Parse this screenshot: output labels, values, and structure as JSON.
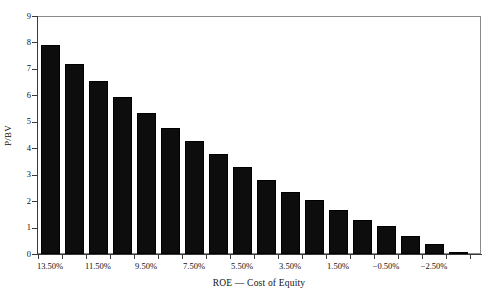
{
  "chart_data": {
    "type": "bar",
    "title": "",
    "xlabel": "ROE — Cost of Equity",
    "ylabel": "P/BV",
    "ylim": [
      0,
      9
    ],
    "ytick_values": [
      0,
      1,
      2,
      3,
      4,
      5,
      6,
      7,
      8,
      9
    ],
    "ytick_labels": [
      "0",
      "1",
      "2",
      "3",
      "4",
      "5",
      "6",
      "7",
      "8",
      "9"
    ],
    "grid": false,
    "legend": null,
    "bar_color": "#0d0d0d",
    "frame_color": "#8a8a8a",
    "axis_color": "#3a3a3a",
    "categories": [
      "13.50%",
      "12.50%",
      "11.50%",
      "10.50%",
      "9.50%",
      "8.50%",
      "7.50%",
      "6.50%",
      "5.50%",
      "4.50%",
      "3.50%",
      "2.50%",
      "1.50%",
      "0.50%",
      "−0.50%",
      "−1.50%",
      "−2.50%",
      "−3.50%"
    ],
    "xtick_labels_shown": [
      "13.50%",
      "",
      "11.50%",
      "",
      "9.50%",
      "",
      "7.50%",
      "",
      "5.50%",
      "",
      "3.50%",
      "",
      "1.50%",
      "",
      "−0.50%",
      "",
      "−2.50%",
      ""
    ],
    "values": [
      7.9,
      7.2,
      6.55,
      5.92,
      5.35,
      4.77,
      4.27,
      3.8,
      3.3,
      2.8,
      2.35,
      2.03,
      1.68,
      1.3,
      1.05,
      0.7,
      0.38,
      0.05
    ]
  }
}
